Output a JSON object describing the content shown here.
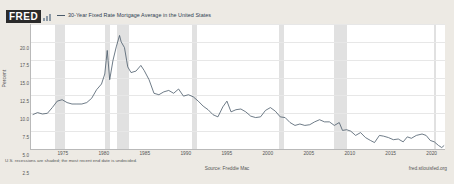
{
  "header": {
    "brand": "FRED",
    "brand_mark_icon": "bar-chart-icon",
    "legend": [
      {
        "label": "30-Year Fixed Rate Mortgage Average in the United States",
        "color": "#4a5a6a"
      }
    ]
  },
  "footer": {
    "note": "U.S. recessions are shaded; the most recent end date is undecided.",
    "source": "Source: Freddie Mac",
    "url": "fred.stlouisfed.org"
  },
  "colors": {
    "line": "#4a5a6a",
    "recession_band": "#dcdcdc",
    "plot_background": "#ffffff",
    "page_background": "#edeae4",
    "grid": "#e7e7e7"
  },
  "chart_data": {
    "type": "line",
    "title": "30-Year Fixed Rate Mortgage Average in the United States",
    "xlabel": "",
    "ylabel": "Percent",
    "xlim": [
      1971,
      2021.5
    ],
    "ylim": [
      2.5,
      20.0
    ],
    "grid": true,
    "legend_position": "top",
    "xticks": [
      1975,
      1980,
      1985,
      1990,
      1995,
      2000,
      2005,
      2010,
      2015,
      2020
    ],
    "xtick_labels": [
      "1975",
      "1980",
      "1985",
      "1990",
      "1995",
      "2000",
      "2005",
      "2010",
      "2015",
      "2020"
    ],
    "yticks": [
      2.5,
      5.0,
      7.5,
      10.0,
      12.5,
      15.0,
      17.5,
      20.0
    ],
    "ytick_labels": [
      "2.5",
      "5.0",
      "7.5",
      "10.0",
      "12.5",
      "15.0",
      "17.5",
      "20.0"
    ],
    "series": [
      {
        "name": "30-Year Fixed Rate Mortgage Average in the United States",
        "color": "#4a5a6a",
        "x": [
          1971.2,
          1971.8,
          1972.4,
          1973.0,
          1973.6,
          1974.2,
          1974.8,
          1975.4,
          1976.0,
          1976.6,
          1977.2,
          1977.8,
          1978.4,
          1979.0,
          1979.6,
          1980.0,
          1980.3,
          1980.6,
          1981.0,
          1981.4,
          1981.8,
          1982.0,
          1982.4,
          1982.8,
          1983.2,
          1983.8,
          1984.4,
          1984.8,
          1985.4,
          1986.0,
          1986.6,
          1987.2,
          1987.8,
          1988.4,
          1989.0,
          1989.6,
          1990.2,
          1990.8,
          1991.4,
          1992.0,
          1992.6,
          1993.2,
          1993.8,
          1994.4,
          1994.9,
          1995.4,
          1996.0,
          1996.6,
          1997.2,
          1997.8,
          1998.4,
          1999.0,
          1999.6,
          2000.2,
          2000.8,
          2001.4,
          2002.0,
          2002.6,
          2003.2,
          2003.8,
          2004.4,
          2005.0,
          2005.6,
          2006.2,
          2006.8,
          2007.4,
          2008.0,
          2008.6,
          2009.0,
          2009.5,
          2010.0,
          2010.6,
          2011.2,
          2011.8,
          2012.4,
          2012.9,
          2013.5,
          2014.0,
          2014.6,
          2015.2,
          2015.8,
          2016.4,
          2016.9,
          2017.4,
          2018.0,
          2018.7,
          2019.2,
          2019.7,
          2020.2,
          2020.7,
          2021.1,
          2021.4
        ],
        "y": [
          7.3,
          7.6,
          7.4,
          7.5,
          8.3,
          9.2,
          9.4,
          9.0,
          8.8,
          8.8,
          8.8,
          9.0,
          9.6,
          10.8,
          11.6,
          13.0,
          16.3,
          12.2,
          14.9,
          16.8,
          18.4,
          17.5,
          16.7,
          14.0,
          13.2,
          13.4,
          14.2,
          13.5,
          12.2,
          10.3,
          10.1,
          10.5,
          10.7,
          10.3,
          10.9,
          9.9,
          10.1,
          9.8,
          9.2,
          8.5,
          8.0,
          7.3,
          7.0,
          8.4,
          9.2,
          7.7,
          8.0,
          8.1,
          7.7,
          7.1,
          6.9,
          7.0,
          7.9,
          8.3,
          7.8,
          7.0,
          6.9,
          6.2,
          5.8,
          6.0,
          5.8,
          5.9,
          6.3,
          6.6,
          6.3,
          6.3,
          5.8,
          6.2,
          5.1,
          5.2,
          5.0,
          4.4,
          4.8,
          4.1,
          3.7,
          3.4,
          4.4,
          4.3,
          4.1,
          3.8,
          3.9,
          3.5,
          4.2,
          4.0,
          4.4,
          4.6,
          4.4,
          3.7,
          3.5,
          3.0,
          2.7,
          3.0
        ]
      }
    ],
    "recessions": [
      {
        "start": 1973.9,
        "end": 1975.2
      },
      {
        "start": 1980.0,
        "end": 1980.6
      },
      {
        "start": 1981.5,
        "end": 1982.9
      },
      {
        "start": 1990.6,
        "end": 1991.2
      },
      {
        "start": 2001.2,
        "end": 2001.9
      },
      {
        "start": 2007.9,
        "end": 2009.5
      },
      {
        "start": 2020.1,
        "end": 2020.4
      }
    ]
  }
}
